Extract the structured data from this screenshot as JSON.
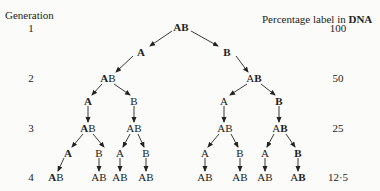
{
  "headers": {
    "left": "Generation",
    "right_prefix": "Percentage label in ",
    "right_bold": "DNA"
  },
  "generations": [
    {
      "number": "1",
      "percent": "100",
      "y": 28
    },
    {
      "number": "2",
      "percent": "50",
      "y": 78
    },
    {
      "number": "3",
      "percent": "25",
      "y": 128
    },
    {
      "number": "4",
      "percent": "12·5",
      "y": 177
    }
  ],
  "nodes": [
    {
      "id": "g1",
      "x": 181,
      "y": 27,
      "parts": [
        {
          "t": "A",
          "bold": true
        },
        {
          "t": "B",
          "bold": true
        }
      ]
    },
    {
      "id": "s1a",
      "x": 141,
      "y": 52,
      "parts": [
        {
          "t": "A",
          "bold": true
        }
      ]
    },
    {
      "id": "s1b",
      "x": 227,
      "y": 52,
      "parts": [
        {
          "t": "B",
          "bold": true
        }
      ]
    },
    {
      "id": "g2a",
      "x": 108,
      "y": 78,
      "parts": [
        {
          "t": "A",
          "bold": true
        },
        {
          "t": "B",
          "bold": false
        }
      ]
    },
    {
      "id": "g2b",
      "x": 254,
      "y": 78,
      "parts": [
        {
          "t": "A",
          "bold": false
        },
        {
          "t": "B",
          "bold": true
        }
      ]
    },
    {
      "id": "s2a",
      "x": 88,
      "y": 101,
      "parts": [
        {
          "t": "A",
          "bold": true
        }
      ]
    },
    {
      "id": "s2b",
      "x": 134,
      "y": 101,
      "parts": [
        {
          "t": "B",
          "bold": false
        }
      ]
    },
    {
      "id": "s2c",
      "x": 224,
      "y": 101,
      "parts": [
        {
          "t": "A",
          "bold": false
        }
      ]
    },
    {
      "id": "s2d",
      "x": 279,
      "y": 101,
      "parts": [
        {
          "t": "B",
          "bold": true
        }
      ]
    },
    {
      "id": "g3a",
      "x": 88,
      "y": 128,
      "parts": [
        {
          "t": "A",
          "bold": true
        },
        {
          "t": "B",
          "bold": false
        }
      ]
    },
    {
      "id": "g3b",
      "x": 134,
      "y": 128,
      "parts": [
        {
          "t": "A",
          "bold": false
        },
        {
          "t": "B",
          "bold": false
        }
      ]
    },
    {
      "id": "g3c",
      "x": 225,
      "y": 128,
      "parts": [
        {
          "t": "A",
          "bold": false
        },
        {
          "t": "B",
          "bold": false
        }
      ]
    },
    {
      "id": "g3d",
      "x": 280,
      "y": 128,
      "parts": [
        {
          "t": "A",
          "bold": false
        },
        {
          "t": "B",
          "bold": true
        }
      ]
    },
    {
      "id": "s3a",
      "x": 68,
      "y": 153,
      "parts": [
        {
          "t": "A",
          "bold": true
        }
      ]
    },
    {
      "id": "s3b",
      "x": 99,
      "y": 153,
      "parts": [
        {
          "t": "B",
          "bold": false
        }
      ]
    },
    {
      "id": "s3c",
      "x": 120,
      "y": 153,
      "parts": [
        {
          "t": "A",
          "bold": false
        }
      ]
    },
    {
      "id": "s3d",
      "x": 146,
      "y": 153,
      "parts": [
        {
          "t": "B",
          "bold": false
        }
      ]
    },
    {
      "id": "s3e",
      "x": 205,
      "y": 153,
      "parts": [
        {
          "t": "A",
          "bold": false
        }
      ]
    },
    {
      "id": "s3f",
      "x": 240,
      "y": 153,
      "parts": [
        {
          "t": "B",
          "bold": false
        }
      ]
    },
    {
      "id": "s3g",
      "x": 265,
      "y": 153,
      "parts": [
        {
          "t": "A",
          "bold": false
        }
      ]
    },
    {
      "id": "s3h",
      "x": 298,
      "y": 153,
      "parts": [
        {
          "t": "B",
          "bold": true
        }
      ]
    },
    {
      "id": "g4a",
      "x": 56,
      "y": 177,
      "parts": [
        {
          "t": "A",
          "bold": true
        },
        {
          "t": "B",
          "bold": false
        }
      ]
    },
    {
      "id": "g4b",
      "x": 99,
      "y": 177,
      "parts": [
        {
          "t": "A",
          "bold": false
        },
        {
          "t": "B",
          "bold": false
        }
      ]
    },
    {
      "id": "g4c",
      "x": 120,
      "y": 177,
      "parts": [
        {
          "t": "A",
          "bold": false
        },
        {
          "t": "B",
          "bold": false
        }
      ]
    },
    {
      "id": "g4d",
      "x": 146,
      "y": 177,
      "parts": [
        {
          "t": "A",
          "bold": false
        },
        {
          "t": "B",
          "bold": false
        }
      ]
    },
    {
      "id": "g4e",
      "x": 205,
      "y": 177,
      "parts": [
        {
          "t": "A",
          "bold": false
        },
        {
          "t": "B",
          "bold": false
        }
      ]
    },
    {
      "id": "g4f",
      "x": 240,
      "y": 177,
      "parts": [
        {
          "t": "A",
          "bold": false
        },
        {
          "t": "B",
          "bold": false
        }
      ]
    },
    {
      "id": "g4g",
      "x": 265,
      "y": 177,
      "parts": [
        {
          "t": "A",
          "bold": false
        },
        {
          "t": "B",
          "bold": false
        }
      ]
    },
    {
      "id": "g4h",
      "x": 298,
      "y": 177,
      "parts": [
        {
          "t": "A",
          "bold": false
        },
        {
          "t": "B",
          "bold": true
        }
      ]
    }
  ],
  "arrows": [
    [
      172,
      31,
      150,
      46
    ],
    [
      191,
      31,
      218,
      46
    ],
    [
      133,
      56,
      116,
      72
    ],
    [
      236,
      56,
      248,
      72
    ],
    [
      102,
      84,
      92,
      95
    ],
    [
      114,
      84,
      130,
      95
    ],
    [
      247,
      84,
      230,
      95
    ],
    [
      261,
      84,
      275,
      95
    ],
    [
      88,
      106,
      88,
      122
    ],
    [
      134,
      106,
      134,
      122
    ],
    [
      224,
      106,
      224,
      122
    ],
    [
      279,
      106,
      279,
      122
    ],
    [
      83,
      134,
      72,
      147
    ],
    [
      93,
      134,
      104,
      147
    ],
    [
      130,
      134,
      123,
      147
    ],
    [
      138,
      134,
      144,
      147
    ],
    [
      219,
      134,
      208,
      147
    ],
    [
      231,
      134,
      238,
      147
    ],
    [
      274,
      134,
      267,
      147
    ],
    [
      286,
      134,
      295,
      147
    ],
    [
      64,
      158,
      58,
      171
    ],
    [
      99,
      158,
      99,
      171
    ],
    [
      120,
      158,
      120,
      171
    ],
    [
      146,
      158,
      146,
      171
    ],
    [
      205,
      158,
      205,
      171
    ],
    [
      240,
      158,
      240,
      171
    ],
    [
      265,
      158,
      265,
      171
    ],
    [
      298,
      158,
      298,
      171
    ]
  ],
  "colors": {
    "ink": "#222222",
    "background": "#fbfbf9"
  }
}
